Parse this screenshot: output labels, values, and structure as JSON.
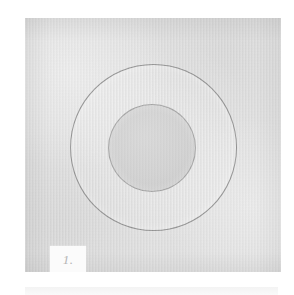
{
  "document": {
    "type": "scanned-plate-figure",
    "page_background": "#ffffff"
  },
  "plate": {
    "name": "plate-panel",
    "background_color": "#dedede",
    "texture": "mottled paper grain",
    "left": 25,
    "top": 18,
    "width": 256,
    "height": 254
  },
  "figure": {
    "outer_circle": {
      "label": "outer-circle",
      "fill": "none",
      "stroke_color": "#707070",
      "stroke_width": 1,
      "diameter": 167,
      "center_x": 128,
      "center_y": 130
    },
    "inner_circle": {
      "label": "inner-circle",
      "fill_color": "#cfcfcf",
      "stroke_color": "#7e7e7e",
      "stroke_width": 1,
      "diameter": 88,
      "center_x": 127,
      "center_y": 130
    },
    "annulus_color": "#e2e2e2"
  },
  "caption": {
    "figure_number": "1.",
    "box_background": "#fbfbfb",
    "text_color": "#b4b4b4",
    "style": "italic serif"
  },
  "next_plate": {
    "band_color": "#f3f3f3"
  }
}
